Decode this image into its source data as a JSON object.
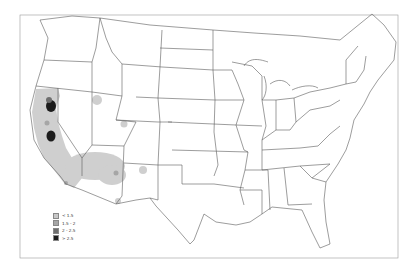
{
  "map": {
    "region": "Contiguous United States",
    "type": "density heatmap"
  },
  "legend": {
    "items": [
      {
        "label": "< 1.5",
        "color": "#c8c8c8"
      },
      {
        "label": "1.5 - 2",
        "color": "#a6a6a6"
      },
      {
        "label": "2 - 2.5",
        "color": "#6e6e6e"
      },
      {
        "label": "> 2.5",
        "color": "#1c1c1c"
      }
    ]
  },
  "hotspots": [
    {
      "area": "Northern California",
      "level": "> 2.5"
    },
    {
      "area": "Central California (Sierra)",
      "level": "> 2.5"
    },
    {
      "area": "California coast & valley",
      "level": "< 1.5"
    },
    {
      "area": "Southern California / Arizona",
      "level": "< 1.5"
    },
    {
      "area": "Southern Idaho",
      "level": "< 1.5"
    },
    {
      "area": "Northwest Colorado",
      "level": "< 1.5"
    },
    {
      "area": "Central New Mexico",
      "level": "< 1.5"
    }
  ]
}
